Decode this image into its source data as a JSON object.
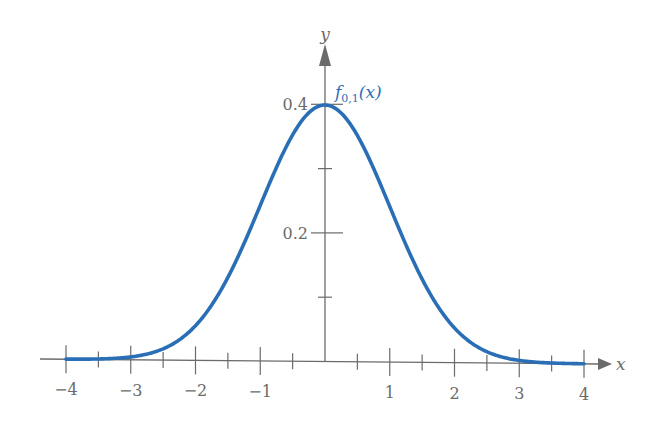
{
  "chart_data": {
    "type": "line",
    "title": "",
    "xlabel": "x",
    "ylabel": "y",
    "xlim": [
      -4,
      4
    ],
    "ylim": [
      0,
      0.45
    ],
    "grid": false,
    "legend": "none",
    "x_ticks": [
      -4,
      -3.5,
      -3,
      -2.5,
      -2,
      -1.5,
      -1,
      -0.5,
      0.5,
      1,
      1.5,
      2,
      2.5,
      3,
      3.5,
      4
    ],
    "x_tick_labels": [
      "−4",
      "−3",
      "−2",
      "−1",
      "1",
      "2",
      "3",
      "4"
    ],
    "x_tick_label_values": [
      -4,
      -3,
      -2,
      -1,
      1,
      2,
      3,
      4
    ],
    "y_ticks": [
      0.1,
      0.2,
      0.3,
      0.4
    ],
    "y_tick_labels": [
      "0.2",
      "0.4"
    ],
    "y_tick_label_values": [
      0.2,
      0.4
    ],
    "series": [
      {
        "name": "f0,1(x)",
        "description": "Standard normal density, mean 0, standard deviation 1",
        "color": "#2a6fb5",
        "x": [
          -4,
          -3.5,
          -3,
          -2.5,
          -2,
          -1.5,
          -1,
          -0.5,
          0,
          0.5,
          1,
          1.5,
          2,
          2.5,
          3,
          3.5,
          4
        ],
        "y": [
          0.0001,
          0.0009,
          0.0044,
          0.0175,
          0.054,
          0.1295,
          0.242,
          0.3521,
          0.3989,
          0.3521,
          0.242,
          0.1295,
          0.054,
          0.0175,
          0.0044,
          0.0009,
          0.0001
        ]
      }
    ],
    "annotations": [
      {
        "text": "f0,1(x)",
        "x": 0.1,
        "y": 0.41
      }
    ]
  },
  "labels": {
    "x_axis": "x",
    "y_axis": "y",
    "curve_main": "f",
    "curve_sub": "0,1",
    "curve_arg": "(x)"
  },
  "colors": {
    "curve": "#2a6fb5",
    "axis": "#6b6b6b"
  }
}
